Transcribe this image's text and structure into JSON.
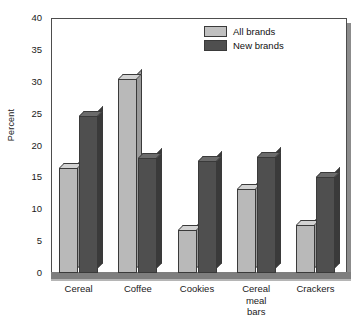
{
  "chart_data": {
    "type": "bar",
    "title": "",
    "xlabel": "",
    "ylabel": "Percent",
    "ylim": [
      0,
      40
    ],
    "yticks": [
      0,
      5,
      10,
      15,
      20,
      25,
      30,
      35,
      40
    ],
    "grid": false,
    "legend_position": "top-right",
    "categories": [
      "Cereal",
      "Coffee",
      "Cookies",
      "Cereal meal bars",
      "Crackers"
    ],
    "category_lines": [
      [
        "Cereal"
      ],
      [
        "Coffee"
      ],
      [
        "Cookies"
      ],
      [
        "Cereal",
        "meal",
        "bars"
      ],
      [
        "Crackers"
      ]
    ],
    "series": [
      {
        "name": "All brands",
        "color": "#b9b9b9",
        "values": [
          16.4,
          30.4,
          6.8,
          13.2,
          7.5
        ]
      },
      {
        "name": "New brands",
        "color": "#4f4f4f",
        "values": [
          24.6,
          18.0,
          17.5,
          18.2,
          15.0
        ]
      }
    ]
  },
  "legend": {
    "items": [
      {
        "label": "All brands",
        "swatch": "light"
      },
      {
        "label": "New brands",
        "swatch": "dark"
      }
    ]
  },
  "axis": {
    "y_title": "Percent",
    "tick_labels": [
      "40",
      "35",
      "30",
      "25",
      "20",
      "15",
      "10",
      "5",
      "0"
    ]
  }
}
